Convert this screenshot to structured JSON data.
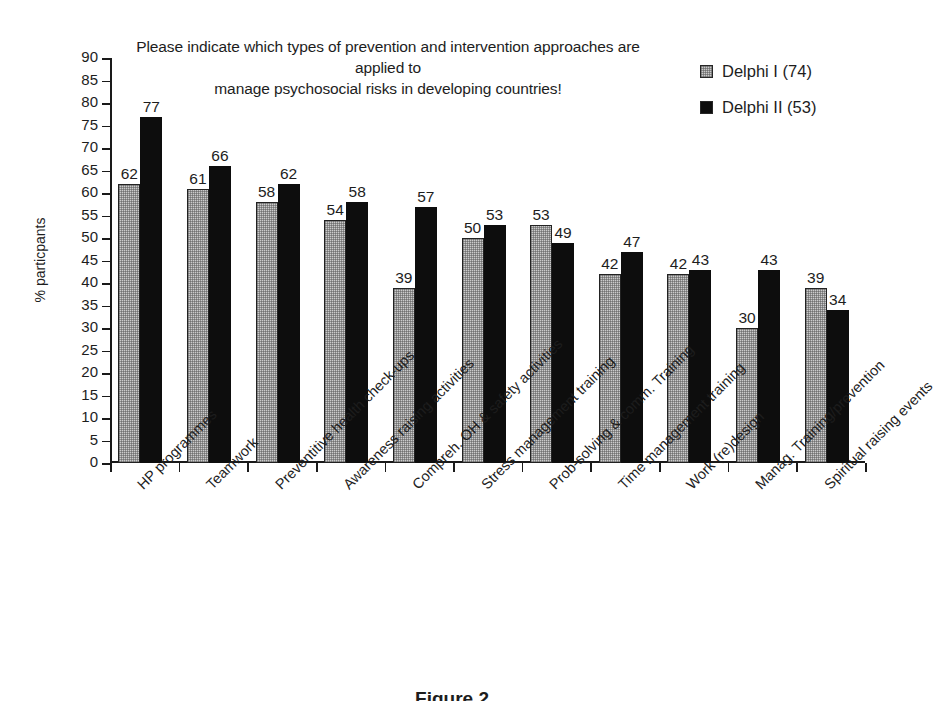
{
  "chart_data": {
    "type": "bar",
    "title": "Please indicate which types of prevention and intervention approaches are applied to manage psychosocial risks in developing countries!",
    "title_line_1": "Please indicate which types of prevention and intervention approaches are applied to",
    "title_line_2": "manage psychosocial risks in developing countries!",
    "xlabel": "",
    "ylabel": "% particpants",
    "ylim": [
      0,
      90
    ],
    "ytick_step": 5,
    "ytick_labels": [
      "90",
      "85",
      "80",
      "75",
      "70",
      "65",
      "60",
      "55",
      "50",
      "45",
      "40",
      "35",
      "30",
      "25",
      "20",
      "15",
      "10",
      "5",
      "0"
    ],
    "grid": false,
    "legend_position": "top-right",
    "categories": [
      "HP programmes",
      "Teamwork",
      "Preventitive health check-ups",
      "Awareness raising activities",
      "Compreh. OH & safety activities",
      "Stress management training",
      "Prob-solving & comm. Training",
      "Time management training",
      "Work (re)design",
      "Manag. Training/prevention",
      "Spiritual raising events"
    ],
    "series": [
      {
        "name": "Delphi I (74)",
        "color": "#cbcbcb",
        "values": [
          62,
          61,
          58,
          54,
          39,
          50,
          53,
          42,
          42,
          30,
          39
        ]
      },
      {
        "name": "Delphi II (53)",
        "color": "#0d0d0d",
        "values": [
          77,
          66,
          62,
          58,
          57,
          53,
          49,
          47,
          43,
          43,
          34
        ]
      }
    ]
  },
  "caption": {
    "text": "Figure 2"
  }
}
